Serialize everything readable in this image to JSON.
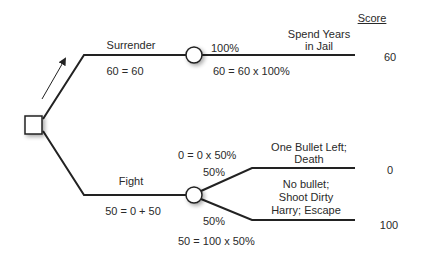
{
  "diagram": {
    "type": "decision-tree",
    "score_header": "Score",
    "decision_node": {
      "shape": "square"
    },
    "branches": [
      {
        "name": "Surrender",
        "label": "Surrender",
        "equation": "60 = 60",
        "chance_node": {
          "outcomes": [
            {
              "probability": "100%",
              "equation": "60 = 60 x 100%",
              "description_lines": [
                "Spend Years",
                "in Jail"
              ],
              "score": "60"
            }
          ]
        }
      },
      {
        "name": "Fight",
        "label": "Fight",
        "equation": "50 = 0 + 50",
        "chance_node": {
          "outcomes": [
            {
              "probability": "50%",
              "equation": "0 = 0 x 50%",
              "description_lines": [
                "One Bullet Left;",
                "Death"
              ],
              "score": "0"
            },
            {
              "probability": "50%",
              "equation": "50 = 100 x 50%",
              "description_lines": [
                "No bullet;",
                "Shoot Dirty",
                "Harry; Escape"
              ],
              "score": "100"
            }
          ]
        }
      }
    ]
  }
}
